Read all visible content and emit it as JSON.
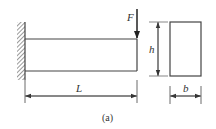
{
  "diagram": {
    "labels": {
      "force": "F",
      "length": "L",
      "height": "h",
      "width": "b",
      "caption": "(a)"
    },
    "colors": {
      "line": "#444444",
      "background": "#ffffff"
    }
  }
}
